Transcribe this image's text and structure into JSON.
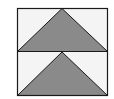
{
  "diagram": {
    "colors": {
      "background": "#ffffff",
      "panel_fill": "#f4f4f4",
      "triangle_fill": "#8a8a8a",
      "stroke": "#1a1a1a"
    },
    "panels": [
      {
        "name": "top",
        "shape": "triangle-up"
      },
      {
        "name": "bottom",
        "shape": "triangle-up"
      }
    ]
  }
}
